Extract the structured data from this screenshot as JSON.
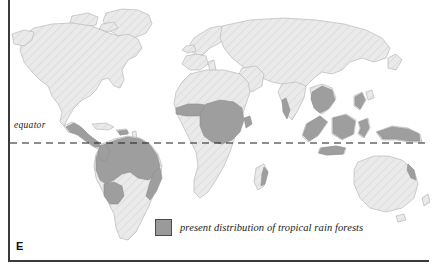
{
  "figure": {
    "panel_letter": "E",
    "background_color": "#ffffff",
    "frame_color": "#3a3a3a"
  },
  "map": {
    "type": "world-map",
    "projection": "equirectangular-ish",
    "land_fill": "#e9e9e9",
    "land_stroke": "#b5b5b5",
    "hatch_color": "#dcdcdc",
    "rainforest_fill": "#9e9e9e",
    "rainforest_stroke": "#8c8c8c",
    "ocean_fill": "#ffffff"
  },
  "equator": {
    "label": "equator",
    "line_style": "dashed",
    "line_color": "#1c1c1c",
    "y_position_px": 143
  },
  "legend": {
    "swatch_color": "#9a9a9a",
    "swatch_border_color": "#4a4a4a",
    "label": "present distribution of tropical rain forests"
  },
  "regions": [
    {
      "name": "north-america",
      "has_rainforest": true
    },
    {
      "name": "central-america",
      "has_rainforest": true
    },
    {
      "name": "south-america",
      "has_rainforest": true
    },
    {
      "name": "africa",
      "has_rainforest": true
    },
    {
      "name": "europe",
      "has_rainforest": false
    },
    {
      "name": "asia",
      "has_rainforest": true
    },
    {
      "name": "southeast-asia-indonesia",
      "has_rainforest": true
    },
    {
      "name": "australia",
      "has_rainforest": false
    },
    {
      "name": "madagascar",
      "has_rainforest": false
    },
    {
      "name": "greenland",
      "has_rainforest": false
    }
  ]
}
